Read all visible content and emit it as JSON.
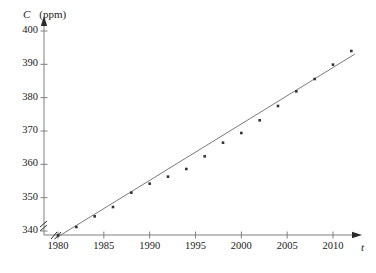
{
  "chart_data": {
    "type": "scatter",
    "title": "",
    "xlabel": "t",
    "ylabel": "C",
    "y_unit": "(ppm)",
    "y_axis_caption": "C (ppm)",
    "xlim": [
      1979,
      2013
    ],
    "ylim": [
      337,
      402
    ],
    "grid": false,
    "legend": null,
    "x_ticks": [
      1980,
      1985,
      1990,
      1995,
      2000,
      2005,
      2010
    ],
    "y_ticks": [
      340,
      350,
      360,
      370,
      380,
      390,
      400
    ],
    "axis_break": true,
    "x": [
      1980,
      1982,
      1984,
      1986,
      1988,
      1990,
      1992,
      1994,
      1996,
      1998,
      2000,
      2002,
      2004,
      2006,
      2008,
      2010,
      2012
    ],
    "values": [
      338.7,
      341.2,
      344.4,
      347.2,
      351.5,
      354.2,
      356.3,
      358.6,
      362.4,
      366.5,
      369.4,
      373.2,
      377.5,
      381.9,
      385.6,
      389.9,
      394.0
    ],
    "series": [
      {
        "name": "CO2 concentration",
        "x": [
          1980,
          1982,
          1984,
          1986,
          1988,
          1990,
          1992,
          1994,
          1996,
          1998,
          2000,
          2002,
          2004,
          2006,
          2008,
          2010,
          2012
        ],
        "values": [
          338.7,
          341.2,
          344.4,
          347.2,
          351.5,
          354.2,
          356.3,
          358.6,
          362.4,
          366.5,
          369.4,
          373.2,
          377.5,
          381.9,
          385.6,
          389.9,
          394.0
        ]
      }
    ],
    "trend_line": {
      "type": "linear-regression",
      "x_start": 1979.6,
      "y_start": 337.6,
      "x_end": 2012.4,
      "y_end": 393.1
    },
    "marker": {
      "shape": "square",
      "size_px": 2.6,
      "color": "#333333"
    },
    "line_color": "#6b6b6b",
    "axis_color": "#808080"
  },
  "axis": {
    "y_caption_symbol": "C",
    "y_caption_unit": "(ppm)",
    "x_caption_symbol": "t"
  },
  "x_tick_labels": [
    "1980",
    "1985",
    "1990",
    "1995",
    "2000",
    "2005",
    "2010"
  ],
  "y_tick_labels": [
    "340",
    "350",
    "360",
    "370",
    "380",
    "390",
    "400"
  ]
}
